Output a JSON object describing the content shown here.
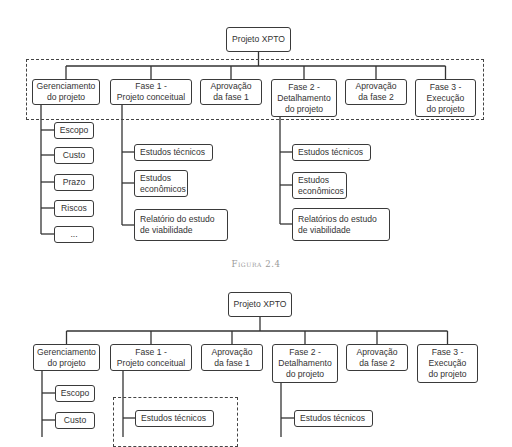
{
  "figures": [
    {
      "id": "top",
      "caption": "Figura 2.4",
      "root": {
        "label": "Projeto XPTO",
        "x": 226,
        "y": 27,
        "w": 65,
        "h": 25
      },
      "group_box": {
        "x": 26,
        "y": 59,
        "w": 458,
        "h": 61
      },
      "bus_y": 66,
      "phases": [
        {
          "label": "Gerenciamento\ndo projeto",
          "x": 32,
          "y": 79,
          "w": 68,
          "h": 26
        },
        {
          "label": "Fase 1  -\nProjeto conceitual",
          "x": 110,
          "y": 79,
          "w": 82,
          "h": 26
        },
        {
          "label": "Aprovação\nda fase 1",
          "x": 200,
          "y": 79,
          "w": 62,
          "h": 26
        },
        {
          "label": "Fase 2 -\nDetalhamento\ndo projeto",
          "x": 271,
          "y": 79,
          "w": 66,
          "h": 38
        },
        {
          "label": "Aprovação\nda fase 2",
          "x": 345,
          "y": 79,
          "w": 62,
          "h": 26
        },
        {
          "label": "Fase 3 -\nExecução\ndo projeto",
          "x": 415,
          "y": 79,
          "w": 61,
          "h": 38
        }
      ],
      "children": [
        {
          "parent": 0,
          "spine_x": 41,
          "items": [
            {
              "label": "Escopo",
              "x": 54,
              "y": 122,
              "w": 40,
              "h": 17,
              "cy": 130
            },
            {
              "label": "Custo",
              "x": 54,
              "y": 147,
              "w": 40,
              "h": 17,
              "cy": 155
            },
            {
              "label": "Prazo",
              "x": 54,
              "y": 174,
              "w": 40,
              "h": 17,
              "cy": 182
            },
            {
              "label": "Riscos",
              "x": 54,
              "y": 200,
              "w": 40,
              "h": 17,
              "cy": 208
            },
            {
              "label": "...",
              "x": 54,
              "y": 226,
              "w": 40,
              "h": 17,
              "cy": 234
            }
          ]
        },
        {
          "parent": 1,
          "spine_x": 122,
          "items": [
            {
              "label": "Estudos técnicos",
              "x": 134,
              "y": 144,
              "w": 79,
              "h": 17,
              "cy": 152,
              "align": "left"
            },
            {
              "label": "Estudos\neconômicos",
              "x": 134,
              "y": 170,
              "w": 54,
              "h": 27,
              "cy": 183,
              "align": "left"
            },
            {
              "label": "Relatório do estudo\nde viabilidade",
              "x": 134,
              "y": 209,
              "w": 94,
              "h": 32,
              "cy": 225,
              "align": "left"
            }
          ]
        },
        {
          "parent": 3,
          "spine_x": 280,
          "items": [
            {
              "label": "Estudos técnicos",
              "x": 292,
              "y": 144,
              "w": 79,
              "h": 17,
              "cy": 152,
              "align": "left"
            },
            {
              "label": "Estudos\neconômicos",
              "x": 292,
              "y": 172,
              "w": 55,
              "h": 27,
              "cy": 185,
              "align": "left"
            },
            {
              "label": "Relatórios do estudo\nde viabilidade",
              "x": 292,
              "y": 208,
              "w": 98,
              "h": 33,
              "cy": 224,
              "align": "left"
            }
          ]
        }
      ],
      "caption_y": 259
    },
    {
      "id": "bottom",
      "root": {
        "label": "Projeto XPTO",
        "x": 228,
        "y": 292,
        "w": 64,
        "h": 25
      },
      "group_box": null,
      "bus_y": 331,
      "phases": [
        {
          "label": "Gerenciamento\ndo projeto",
          "x": 33,
          "y": 344,
          "w": 67,
          "h": 27
        },
        {
          "label": "Fase 1  -\nProjeto conceitual",
          "x": 110,
          "y": 344,
          "w": 82,
          "h": 27
        },
        {
          "label": "Aprovação\nda fase 1",
          "x": 201,
          "y": 344,
          "w": 62,
          "h": 27
        },
        {
          "label": "Fase 2 -\nDetalhamento\ndo projeto",
          "x": 272,
          "y": 344,
          "w": 66,
          "h": 39
        },
        {
          "label": "Aprovação\nda fase 2",
          "x": 346,
          "y": 344,
          "w": 62,
          "h": 27
        },
        {
          "label": "Fase 3 -\nExecução\ndo projeto",
          "x": 417,
          "y": 344,
          "w": 61,
          "h": 39
        }
      ],
      "dashed_box": {
        "x": 113,
        "y": 397,
        "w": 125,
        "h": 50
      },
      "children": [
        {
          "parent": 0,
          "spine_x": 42,
          "items": [
            {
              "label": "Escopo",
              "x": 55,
              "y": 385,
              "w": 40,
              "h": 17,
              "cy": 393
            },
            {
              "label": "Custo",
              "x": 55,
              "y": 412,
              "w": 40,
              "h": 17,
              "cy": 420
            }
          ]
        },
        {
          "parent": 1,
          "spine_x": 123,
          "items": [
            {
              "label": "Estudos técnicos",
              "x": 135,
              "y": 410,
              "w": 79,
              "h": 17,
              "cy": 418,
              "align": "left"
            }
          ]
        },
        {
          "parent": 3,
          "spine_x": 281,
          "items": [
            {
              "label": "Estudos técnicos",
              "x": 294,
              "y": 410,
              "w": 79,
              "h": 17,
              "cy": 418,
              "align": "left"
            }
          ]
        }
      ]
    }
  ]
}
